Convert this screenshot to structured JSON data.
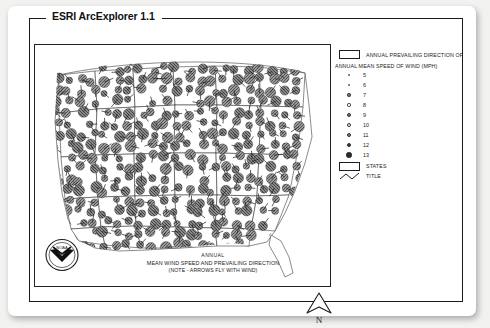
{
  "window": {
    "title": "ESRI ArcExplorer 1.1"
  },
  "legend": {
    "direction_entry": {
      "label": "ANNUAL PREVAILING DIRECTION OF WIND",
      "symbol": "rectangle-swatch"
    },
    "speed_header": "ANNUAL MEAN SPEED OF WIND (MPH)",
    "speed_classes": [
      {
        "value": "5",
        "dot_px": 2.2,
        "fill": "#ffffff"
      },
      {
        "value": "6",
        "dot_px": 2.8,
        "fill": "#ffffff"
      },
      {
        "value": "7",
        "dot_px": 3.2,
        "fill": "#6e6e6e"
      },
      {
        "value": "8",
        "dot_px": 3.4,
        "fill": "#ffffff"
      },
      {
        "value": "9",
        "dot_px": 3.8,
        "fill": "#7a7a7a"
      },
      {
        "value": "10",
        "dot_px": 4.0,
        "fill": "#ffffff"
      },
      {
        "value": "11",
        "dot_px": 4.4,
        "fill": "#8a8a8a"
      },
      {
        "value": "12",
        "dot_px": 4.8,
        "fill": "#3d3d3d"
      },
      {
        "value": "13",
        "dot_px": 5.2,
        "fill": "#2a2a2a"
      }
    ],
    "states_entry": {
      "label": "STATES",
      "symbol": "rectangle-swatch"
    },
    "title_entry": {
      "label": "TITLE",
      "symbol": "zigzag-line-swatch"
    }
  },
  "map": {
    "caption_line1": "ANNUAL",
    "caption_line2": "MEAN WIND SPEED AND PREVAILING DIRECTION",
    "caption_line3": "(NOTE - ARROWS FLY WITH WIND)",
    "seal_text": "NOAA",
    "north_label": "N"
  },
  "colors": {
    "frame": "#1a1a1a",
    "map_border": "#222222",
    "symbol_gray": "#8c8c8c",
    "page_bg": "#f2f2f1"
  }
}
